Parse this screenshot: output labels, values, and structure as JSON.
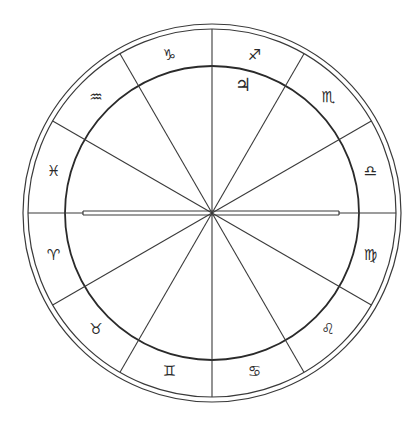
{
  "chart": {
    "type": "zodiac-wheel",
    "center": [
      212,
      213
    ],
    "outer_radius": 189,
    "outer_inner_radius": 184,
    "inner_radius": 147,
    "line_color": "#3a3a3a",
    "background": "#ffffff",
    "horizon_line": {
      "x1": 83,
      "x2": 339,
      "gap": 4
    },
    "cusp_angles_deg": [
      30,
      60,
      90,
      120,
      150,
      210,
      240,
      270,
      300,
      330
    ]
  },
  "signs": [
    {
      "name": "Libra",
      "glyph": "♎",
      "angle": 15
    },
    {
      "name": "Scorpio",
      "glyph": "♏",
      "angle": 45
    },
    {
      "name": "Sagittarius",
      "glyph": "♐",
      "angle": 75
    },
    {
      "name": "Capricorn",
      "glyph": "♑",
      "angle": 105
    },
    {
      "name": "Aquarius",
      "glyph": "♒",
      "angle": 135
    },
    {
      "name": "Pisces",
      "glyph": "♓",
      "angle": 165
    },
    {
      "name": "Aries",
      "glyph": "♈",
      "angle": 195
    },
    {
      "name": "Taurus",
      "glyph": "♉",
      "angle": 225
    },
    {
      "name": "Gemini",
      "glyph": "♊",
      "angle": 255
    },
    {
      "name": "Cancer",
      "glyph": "♋",
      "angle": 285
    },
    {
      "name": "Leo",
      "glyph": "♌",
      "angle": 315
    },
    {
      "name": "Virgo",
      "glyph": "♍",
      "angle": 345
    }
  ],
  "planets": [
    {
      "name": "Jupiter",
      "glyph": "♃",
      "x": 243,
      "y": 85
    }
  ]
}
